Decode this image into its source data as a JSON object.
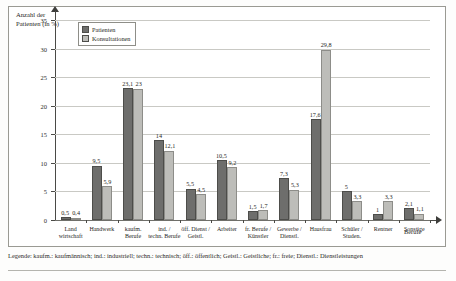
{
  "chart_data": {
    "type": "bar",
    "title": "",
    "ylabel": "Anzahl der Patienten (in %)",
    "xlabel": "Berufe",
    "ylim": [
      0,
      35
    ],
    "yticks": [
      0,
      5,
      10,
      15,
      20,
      25,
      30,
      35
    ],
    "grid": true,
    "legend_position": "top-left-inside",
    "categories": [
      "Land wirtschaft",
      "Handwerk",
      "kaufm. Berufe",
      "ind. / techn. Berufe",
      "öff. Dienst / Geistl.",
      "Arbeiter",
      "fr. Berufe / Künstler",
      "Gewerbe / Dienstl.",
      "Hausfrau",
      "Schüler / Studen.",
      "Rentner",
      "Sonstige"
    ],
    "series": [
      {
        "name": "Patienten",
        "color": "#6e6e6c",
        "values": [
          0.5,
          9.5,
          23.1,
          14,
          5.5,
          10.5,
          1.5,
          7.3,
          17.6,
          5,
          1,
          2.1
        ]
      },
      {
        "name": "Konsultationen",
        "color": "#bdbdb9",
        "values": [
          0.4,
          5.9,
          23,
          12.1,
          4.5,
          9.2,
          1.7,
          5.3,
          29.8,
          3.3,
          3.3,
          1.1
        ]
      }
    ],
    "value_labels": [
      [
        "0,5",
        "0,4"
      ],
      [
        "9,5",
        "5,9"
      ],
      [
        "23,1",
        "23"
      ],
      [
        "14",
        "12,1"
      ],
      [
        "5,5",
        "4,5"
      ],
      [
        "10,5",
        "9,2"
      ],
      [
        "1,5",
        "1,7"
      ],
      [
        "7,3",
        "5,3"
      ],
      [
        "17,6",
        "29,8"
      ],
      [
        "5",
        "3,3"
      ],
      [
        "1",
        "3,3"
      ],
      [
        "2,1",
        "1,1"
      ]
    ],
    "ytick_labels": [
      "0",
      "5",
      "10",
      "15",
      "20",
      "25",
      "30",
      "35"
    ]
  },
  "legend": {
    "items": [
      {
        "label": "Patienten"
      },
      {
        "label": "Konsultationen"
      }
    ]
  },
  "footnote": {
    "text": "Legende: kaufm.: kaufmännisch; ind.: industriell; techn.: technisch; öff.: öffentlich; Geistl.: Geistliche; fr.: freie; Dienstl.: Dienstleistungen"
  }
}
